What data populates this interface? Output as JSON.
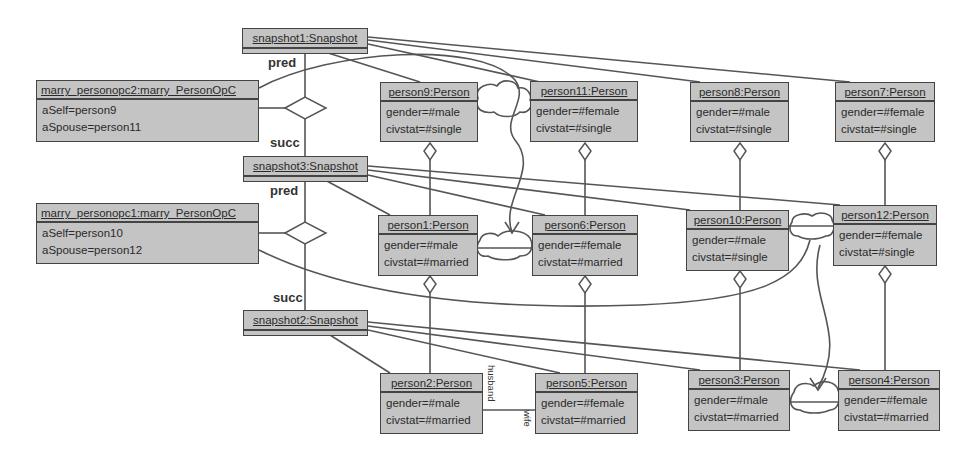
{
  "snapshots": [
    {
      "id": "snapshot1",
      "label": "snapshot1:Snapshot"
    },
    {
      "id": "snapshot3",
      "label": "snapshot3:Snapshot"
    },
    {
      "id": "snapshot2",
      "label": "snapshot2:Snapshot"
    }
  ],
  "operations": [
    {
      "id": "marry_personopc2",
      "label": "marry_personopc2:marry_PersonOpC",
      "attrs": [
        "aSelf=person9",
        "aSpouse=person11"
      ]
    },
    {
      "id": "marry_personopc1",
      "label": "marry_personopc1:marry_PersonOpC",
      "attrs": [
        "aSelf=person10",
        "aSpouse=person12"
      ]
    }
  ],
  "roles": {
    "pred1": "pred",
    "succ1": "succ",
    "pred2": "pred",
    "succ2": "succ",
    "husband": "husband",
    "wife": "wife"
  },
  "persons": {
    "row1": [
      {
        "label": "person9:Person",
        "attrs": [
          "gender=#male",
          "civstat=#single"
        ]
      },
      {
        "label": "person11:Person",
        "attrs": [
          "gender=#female",
          "civstat=#single"
        ]
      },
      {
        "label": "person8:Person",
        "attrs": [
          "gender=#male",
          "civstat=#single"
        ]
      },
      {
        "label": "person7:Person",
        "attrs": [
          "gender=#female",
          "civstat=#single"
        ]
      }
    ],
    "row2": [
      {
        "label": "person1:Person",
        "attrs": [
          "gender=#male",
          "civstat=#married"
        ]
      },
      {
        "label": "person6:Person",
        "attrs": [
          "gender=#female",
          "civstat=#married"
        ]
      },
      {
        "label": "person10:Person",
        "attrs": [
          "gender=#male",
          "civstat=#single"
        ]
      },
      {
        "label": "person12:Person",
        "attrs": [
          "gender=#female",
          "civstat=#single"
        ]
      }
    ],
    "row3": [
      {
        "label": "person2:Person",
        "attrs": [
          "gender=#male",
          "civstat=#married"
        ]
      },
      {
        "label": "person5:Person",
        "attrs": [
          "gender=#female",
          "civstat=#married"
        ]
      },
      {
        "label": "person3:Person",
        "attrs": [
          "gender=#male",
          "civstat=#married"
        ]
      },
      {
        "label": "person4:Person",
        "attrs": [
          "gender=#female",
          "civstat=#married"
        ]
      }
    ]
  },
  "colors": {
    "box_fill": "#c4c4c4",
    "line": "#444444",
    "background": "#ffffff"
  }
}
